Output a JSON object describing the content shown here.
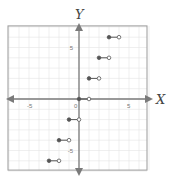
{
  "chart_data": {
    "type": "scatter",
    "subtype": "step-function",
    "title": "",
    "xlabel": "X",
    "ylabel": "Y",
    "xlim": [
      -7,
      7
    ],
    "ylim": [
      -7,
      7
    ],
    "grid": true,
    "x_tick_labels": [
      {
        "value": -5,
        "label": "-5"
      },
      {
        "value": 0,
        "label": "0"
      },
      {
        "value": 5,
        "label": "5"
      }
    ],
    "y_tick_labels": [
      {
        "value": 5,
        "label": "5"
      },
      {
        "value": -5,
        "label": "-5"
      }
    ],
    "segments": [
      {
        "x_start": -3,
        "x_end": -2,
        "y": -6,
        "start": "closed",
        "end": "open"
      },
      {
        "x_start": -2,
        "x_end": -1,
        "y": -4,
        "start": "closed",
        "end": "open"
      },
      {
        "x_start": -1,
        "x_end": 0,
        "y": -2,
        "start": "closed",
        "end": "open"
      },
      {
        "x_start": 0,
        "x_end": 1,
        "y": 0,
        "start": "closed",
        "end": "open"
      },
      {
        "x_start": 1,
        "x_end": 2,
        "y": 2,
        "start": "closed",
        "end": "open"
      },
      {
        "x_start": 2,
        "x_end": 3,
        "y": 4,
        "start": "closed",
        "end": "open"
      },
      {
        "x_start": 3,
        "x_end": 4,
        "y": 6,
        "start": "closed",
        "end": "open"
      }
    ],
    "colors": {
      "axis": "#7a7a7a",
      "grid": "#e4e4e4",
      "frame": "#9a9a9a",
      "segment": "#555555"
    }
  }
}
